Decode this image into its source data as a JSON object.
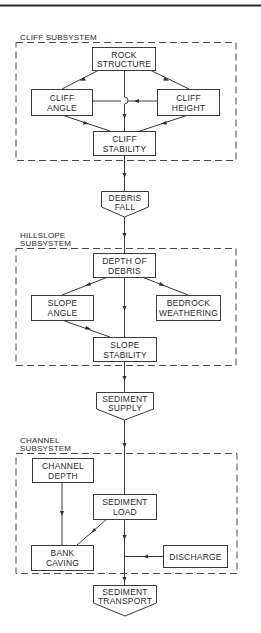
{
  "diagram": {
    "type": "flowchart",
    "subsystems": [
      {
        "id": "cliff",
        "label_lines": [
          "CLIFF SUBSYSTEM"
        ],
        "nodes": [
          {
            "id": "rock-structure",
            "lines": [
              "ROCK",
              "STRUCTURE"
            ]
          },
          {
            "id": "cliff-angle",
            "lines": [
              "CLIFF",
              "ANGLE"
            ]
          },
          {
            "id": "cliff-height",
            "lines": [
              "CLIFF",
              "HEIGHT"
            ]
          },
          {
            "id": "cliff-stability",
            "lines": [
              "CLIFF",
              "STABILITY"
            ]
          }
        ]
      },
      {
        "id": "hillslope",
        "label_lines": [
          "HILLSLOPE",
          "SUBSYSTEM"
        ],
        "nodes": [
          {
            "id": "depth-of-debris",
            "lines": [
              "DEPTH OF",
              "DEBRIS"
            ]
          },
          {
            "id": "slope-angle",
            "lines": [
              "SLOPE",
              "ANGLE"
            ]
          },
          {
            "id": "bedrock-weathering",
            "lines": [
              "BEDROCK",
              "WEATHERING"
            ]
          },
          {
            "id": "slope-stability",
            "lines": [
              "SLOPE",
              "STABILITY"
            ]
          }
        ]
      },
      {
        "id": "channel",
        "label_lines": [
          "CHANNEL",
          "SUBSYSTEM"
        ],
        "nodes": [
          {
            "id": "channel-depth",
            "lines": [
              "CHANNEL",
              "DEPTH"
            ]
          },
          {
            "id": "sediment-load",
            "lines": [
              "SEDIMENT",
              "LOAD"
            ]
          },
          {
            "id": "bank-caving",
            "lines": [
              "BANK",
              "CAVING"
            ]
          },
          {
            "id": "discharge",
            "lines": [
              "DISCHARGE"
            ]
          }
        ]
      }
    ],
    "outputs": [
      {
        "id": "debris-fall",
        "lines": [
          "DEBRIS",
          "FALL"
        ]
      },
      {
        "id": "sediment-supply",
        "lines": [
          "SEDIMENT",
          "SUPPLY"
        ]
      },
      {
        "id": "sediment-transport",
        "lines": [
          "SEDIMENT",
          "TRANSPORT"
        ]
      }
    ],
    "edges": [
      {
        "from": "rock-structure",
        "to": "cliff-angle"
      },
      {
        "from": "rock-structure",
        "to": "cliff-height"
      },
      {
        "from": "rock-structure",
        "to": "cliff-stability"
      },
      {
        "from": "cliff-height",
        "to": "cliff-angle"
      },
      {
        "from": "cliff-angle",
        "to": "cliff-stability"
      },
      {
        "from": "cliff-height",
        "to": "cliff-stability"
      },
      {
        "from": "cliff-stability",
        "to": "debris-fall"
      },
      {
        "from": "debris-fall",
        "to": "depth-of-debris"
      },
      {
        "from": "slope-angle",
        "to": "depth-of-debris"
      },
      {
        "from": "bedrock-weathering",
        "to": "depth-of-debris"
      },
      {
        "from": "depth-of-debris",
        "to": "slope-stability"
      },
      {
        "from": "slope-angle",
        "to": "slope-stability"
      },
      {
        "from": "slope-stability",
        "to": "sediment-supply"
      },
      {
        "from": "sediment-supply",
        "to": "sediment-load"
      },
      {
        "from": "channel-depth",
        "to": "bank-caving"
      },
      {
        "from": "bank-caving",
        "to": "sediment-load"
      },
      {
        "from": "sediment-load",
        "to": "sediment-transport"
      },
      {
        "from": "discharge",
        "to": "sediment-transport"
      }
    ],
    "colors": {
      "line": "#3a3a3a",
      "background": "#ffffff",
      "text": "#2a2a2a"
    }
  }
}
